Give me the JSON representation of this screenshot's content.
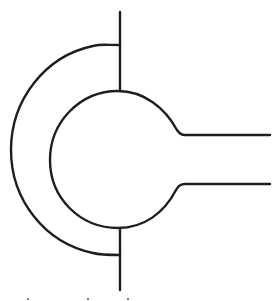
{
  "diagram": {
    "title": "",
    "colors": {
      "background": "#ffffff",
      "stroke": "#1e1e1e"
    },
    "stroke_width": 2.4,
    "elements": {
      "vertical_line_top": {
        "x": 120,
        "y1": 12,
        "y2": 91
      },
      "vertical_line_bottom": {
        "x": 120,
        "y1": 228,
        "y2": 290
      },
      "outer_arc": {
        "cx": 120,
        "cy": 150,
        "start_y": 45,
        "end_y": 255,
        "leftmost_x": 11
      },
      "inner_circle": {
        "cx": 118,
        "cy": 160,
        "top_y": 91,
        "bottom_y": 228,
        "leftmost_x": 50
      },
      "outlet_upper": {
        "x1": 182,
        "y": 135,
        "x2": 270
      },
      "outlet_lower": {
        "x1": 182,
        "y": 184,
        "x2": 270
      }
    },
    "bottom_marks": [
      {
        "x": 28,
        "y": 298
      },
      {
        "x": 88,
        "y": 298
      },
      {
        "x": 128,
        "y": 298
      }
    ]
  }
}
